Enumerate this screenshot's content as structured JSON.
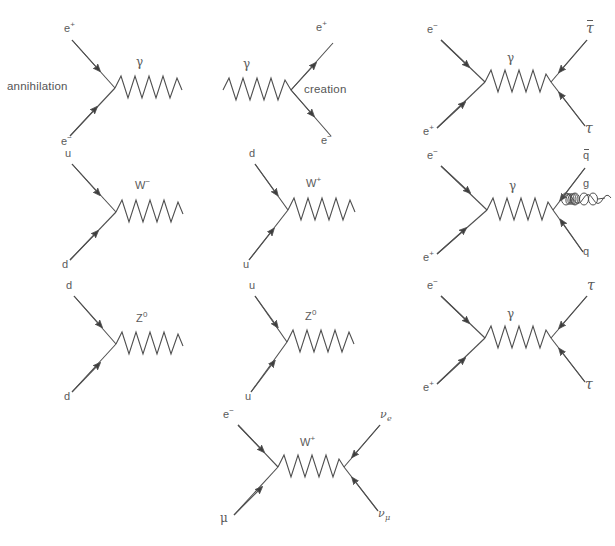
{
  "page": {
    "background_color": "#ffffff",
    "line_color": "#4f4f4f",
    "text_color": "#5a5a5a",
    "width": 597,
    "height": 546
  },
  "diagrams": [
    {
      "id": "annihilation",
      "name": "electron-positron-annihilation",
      "caption": "annihilation",
      "in_top": "e+",
      "in_bottom": "e-",
      "boson": "γ",
      "in_top_html": "e<span class=\"sup\">+</span>",
      "in_bottom_html": "e<span class=\"sup\">−</span>",
      "boson_html": "γ"
    },
    {
      "id": "creation",
      "name": "pair-creation",
      "caption": "creation",
      "out_top": "e+",
      "out_bottom": "e-",
      "boson": "γ",
      "out_top_html": "e<span class=\"sup\">+</span>",
      "out_bottom_html": "e<span class=\"sup\">−</span>",
      "boson_html": "γ"
    },
    {
      "id": "ee-to-tautau-bar",
      "name": "electron-positron-to-tau-antitau",
      "in_top": "e-",
      "in_bottom": "e+",
      "boson": "γ",
      "out_top": "tau-bar",
      "out_bottom": "tau",
      "in_top_html": "e<span class=\"sup\">−</span>",
      "in_bottom_html": "e<span class=\"sup\">+</span>",
      "boson_html": "γ",
      "out_top_html": "<span class=\"ovr\">τ</span>",
      "out_bottom_html": "τ"
    },
    {
      "id": "u-d-w-minus",
      "name": "up-down-w-minus-vertex",
      "in_top": "u",
      "in_bottom": "d",
      "boson": "W-",
      "in_top_html": "u",
      "in_bottom_html": "d",
      "boson_html": "W<span class=\"sup\">−</span>"
    },
    {
      "id": "d-u-w-plus",
      "name": "down-up-w-plus-vertex",
      "in_top": "d",
      "in_bottom": "u",
      "boson": "W+",
      "in_top_html": "d",
      "in_bottom_html": "u",
      "boson_html": "W<span class=\"sup\">+</span>"
    },
    {
      "id": "ee-to-qqbar-gluon",
      "name": "electron-positron-to-quark-antiquark-gluon",
      "in_top": "e-",
      "in_bottom": "e+",
      "boson": "γ",
      "out_top": "q-bar",
      "out_bottom": "q",
      "gluon": "g",
      "in_top_html": "e<span class=\"sup\">−</span>",
      "in_bottom_html": "e<span class=\"sup\">+</span>",
      "boson_html": "γ",
      "out_top_html": "<span class=\"ovr\">q</span>",
      "out_bottom_html": "q",
      "gluon_html": "g"
    },
    {
      "id": "d-d-z0",
      "name": "down-down-z-zero-vertex",
      "in_top": "d",
      "in_bottom": "d",
      "boson": "Z0",
      "in_top_html": "d",
      "in_bottom_html": "d",
      "boson_html": "Z<span class=\"sup\">0</span>"
    },
    {
      "id": "u-u-z0",
      "name": "up-up-z-zero-vertex",
      "in_top": "u",
      "in_bottom": "u",
      "boson": "Z0",
      "in_top_html": "u",
      "in_bottom_html": "u",
      "boson_html": "Z<span class=\"sup\">0</span>"
    },
    {
      "id": "ee-to-tautau",
      "name": "electron-positron-to-tau-tau",
      "in_top": "e-",
      "in_bottom": "e+",
      "boson": "γ",
      "out_top": "tau",
      "out_bottom": "tau",
      "in_top_html": "e<span class=\"sup\">−</span>",
      "in_bottom_html": "e<span class=\"sup\">+</span>",
      "boson_html": "γ",
      "out_top_html": "τ",
      "out_bottom_html": "τ"
    },
    {
      "id": "emu-to-nuenumu",
      "name": "electron-muon-to-neutrinos-w-exchange",
      "in_top": "e-",
      "in_bottom": "μ",
      "boson": "W+",
      "out_top": "nu_e",
      "out_bottom": "nu_mu",
      "in_top_html": "e<span class=\"sup\">−</span>",
      "in_bottom_html": "μ",
      "boson_html": "W<span class=\"sup\">+</span>",
      "out_top_html": "ν<span class=\"sub\">e</span>",
      "out_bottom_html": "ν<span class=\"sub\">μ</span>"
    }
  ]
}
